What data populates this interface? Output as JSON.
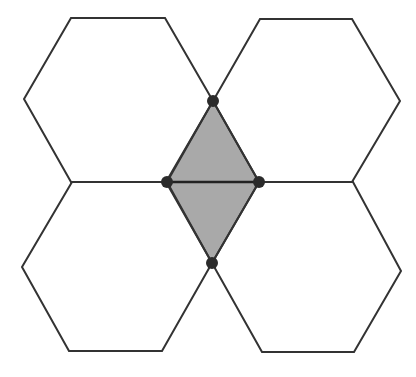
{
  "diagram": {
    "colors": {
      "background": "#ffffff",
      "stroke": "#333333",
      "shaded_fill": "#a9a9a9",
      "dot": "#2b2b2b"
    },
    "hexagons": [
      {
        "id": "top-left",
        "points": "71,18 165,18 213,101 166,182 71,182 24,99"
      },
      {
        "id": "top-right",
        "points": "260,19 352,19 400,101 352,182 259,182 213,101"
      },
      {
        "id": "bottom-left",
        "points": "72,182 166,182 212,263 162,351 69,351 22,267"
      },
      {
        "id": "bottom-right",
        "points": "259,182 353,182 401,271 354,352 262,352 212,263"
      }
    ],
    "shaded_triangles": [
      {
        "id": "upper-triangle",
        "points": "213,101 259,182 167,182"
      },
      {
        "id": "lower-triangle",
        "points": "167,182 259,182 212,263"
      }
    ],
    "vertices": [
      {
        "id": "top",
        "x": 213,
        "y": 101
      },
      {
        "id": "left",
        "x": 167,
        "y": 182
      },
      {
        "id": "right",
        "x": 259,
        "y": 182
      },
      {
        "id": "bottom",
        "x": 212,
        "y": 263
      }
    ]
  }
}
